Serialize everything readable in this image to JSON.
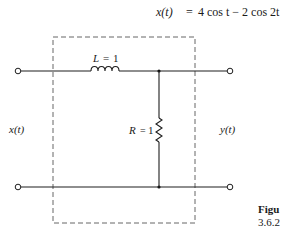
{
  "equation": {
    "lhs": "x(t)",
    "equals": "=",
    "rhs": "4 cos t − 2 cos 2t"
  },
  "circuit": {
    "inductor": {
      "symbol": "L",
      "value": "1",
      "label": "L = 1"
    },
    "resistor": {
      "symbol": "R",
      "value": "1",
      "label": "R = 1"
    },
    "input_label": "x(t)",
    "output_label": "y(t)",
    "enclosure": "dashed-box"
  },
  "caption": {
    "prefix": "Figu",
    "number": "3.6.2"
  }
}
